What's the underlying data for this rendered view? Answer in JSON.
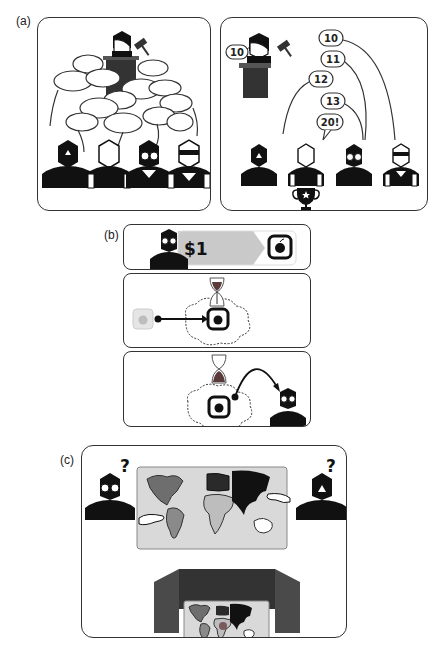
{
  "figure": {
    "panels": [
      {
        "id": "a",
        "label": "(a)",
        "subpanels": [
          "open-outcry-auction",
          "sequential-bidding-auction"
        ]
      },
      {
        "id": "b",
        "label": "(b)",
        "subpanels": [
          "pay-dollar-for-item",
          "item-locked-with-timer",
          "item-transferred-after-timer"
        ]
      },
      {
        "id": "c",
        "label": "(c)",
        "subpanels": [
          "players-point-at-world-map",
          "screened-private-map"
        ]
      }
    ]
  },
  "panel_a": {
    "label": "(a)",
    "auctioneer_bid": "10",
    "bids": [
      "10",
      "11",
      "12",
      "13",
      "20!"
    ],
    "winner_icon": "trophy-star"
  },
  "panel_b": {
    "label": "(b)",
    "price": "$1",
    "item_icon": "apple"
  },
  "panel_c": {
    "label": "(c)",
    "left_question": "?",
    "right_question": "?"
  },
  "colors": {
    "ink": "#111111",
    "podium": "#3a3a3a",
    "gray_fill": "#cfcfcf",
    "map_panel": "#d9d9d9",
    "dark_continent": "#1a1a1a",
    "mid_continent": "#6e6e6e",
    "light_continent": "#a8a8a8",
    "screen": "#4a4a4a"
  }
}
